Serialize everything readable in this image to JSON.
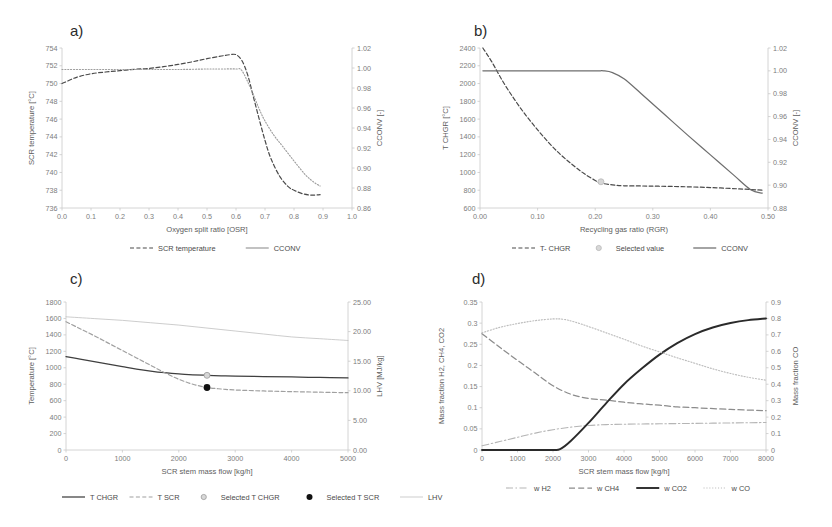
{
  "figure": {
    "panels": [
      "a)",
      "b)",
      "c)",
      "d)"
    ]
  },
  "chart_data": [
    {
      "id": "a",
      "type": "line",
      "panel_label": "a)",
      "title": "",
      "xlabel": "Oxygen split ratio [OSR]",
      "ylabel": "SCR temperature [°C]",
      "y2label": "CCONV [-]",
      "xlim": [
        0.0,
        1.0
      ],
      "ylim": [
        736,
        754
      ],
      "y2lim": [
        0.86,
        1.02
      ],
      "xticks": [
        "0.0",
        "0.1",
        "0.2",
        "0.3",
        "0.4",
        "0.5",
        "0.6",
        "0.7",
        "0.8",
        "0.9",
        "1.0"
      ],
      "yticks": [
        "736",
        "738",
        "740",
        "742",
        "744",
        "746",
        "748",
        "750",
        "752",
        "754"
      ],
      "y2ticks": [
        "0.86",
        "0.88",
        "0.90",
        "0.92",
        "0.94",
        "0.96",
        "0.98",
        "1.00",
        "1.02"
      ],
      "grid": false,
      "legend_position": "bottom",
      "series": [
        {
          "name": "SCR temperature",
          "style": "dashed",
          "color": "#4a4a4a",
          "axis": "left",
          "x": [
            0.0,
            0.05,
            0.1,
            0.15,
            0.2,
            0.25,
            0.3,
            0.35,
            0.4,
            0.45,
            0.5,
            0.55,
            0.58,
            0.6,
            0.62,
            0.64,
            0.66,
            0.68,
            0.7,
            0.72,
            0.75,
            0.78,
            0.8,
            0.83,
            0.86,
            0.89
          ],
          "values": [
            750.0,
            750.7,
            751.1,
            751.3,
            751.45,
            751.6,
            751.7,
            751.9,
            752.15,
            752.45,
            752.8,
            753.1,
            753.25,
            753.25,
            752.6,
            751.0,
            748.5,
            746.0,
            743.6,
            741.6,
            739.6,
            738.4,
            738.0,
            737.6,
            737.45,
            737.5
          ]
        },
        {
          "name": "CCONV",
          "style": "dotted",
          "color": "#9e9e9e",
          "axis": "right",
          "x": [
            0.0,
            0.1,
            0.2,
            0.3,
            0.4,
            0.5,
            0.55,
            0.6,
            0.62,
            0.65,
            0.68,
            0.7,
            0.73,
            0.76,
            0.8,
            0.84,
            0.87,
            0.89
          ],
          "values": [
            0.9985,
            0.9985,
            0.9985,
            0.9985,
            0.9985,
            0.999,
            0.999,
            0.999,
            0.9975,
            0.98,
            0.959,
            0.947,
            0.933,
            0.922,
            0.907,
            0.893,
            0.8855,
            0.882
          ]
        }
      ],
      "legend": [
        {
          "label": "SCR temperature",
          "style": "dashed",
          "color": "#4a4a4a"
        },
        {
          "label": "CCONV",
          "style": "solid",
          "color": "#9e9e9e"
        }
      ]
    },
    {
      "id": "b",
      "type": "line",
      "panel_label": "b)",
      "title": "",
      "xlabel": "Recycling gas ratio (RGR)",
      "ylabel": "T CHGR [°C]",
      "y2label": "CCONV [-]",
      "xlim": [
        0.0,
        0.5
      ],
      "ylim": [
        600,
        2400
      ],
      "y2lim": [
        0.88,
        1.02
      ],
      "xticks": [
        "0.00",
        "0.10",
        "0.20",
        "0.30",
        "0.40",
        "0.50"
      ],
      "yticks": [
        "600",
        "800",
        "1000",
        "1200",
        "1400",
        "1600",
        "1800",
        "2000",
        "2200",
        "2400"
      ],
      "y2ticks": [
        "0.88",
        "0.90",
        "0.92",
        "0.94",
        "0.96",
        "0.98",
        "1.00",
        "1.02"
      ],
      "grid": false,
      "legend_position": "bottom",
      "series": [
        {
          "name": "T- CHGR",
          "style": "dashed",
          "color": "#4a4a4a",
          "axis": "left",
          "x": [
            0.005,
            0.02,
            0.04,
            0.06,
            0.08,
            0.1,
            0.12,
            0.14,
            0.16,
            0.18,
            0.2,
            0.21,
            0.23,
            0.25,
            0.28,
            0.31,
            0.35,
            0.4,
            0.45,
            0.49
          ],
          "values": [
            2400,
            2250,
            2020,
            1820,
            1640,
            1480,
            1330,
            1200,
            1090,
            990,
            910,
            880,
            860,
            850,
            848,
            845,
            840,
            830,
            815,
            800
          ]
        },
        {
          "name": "CCONV",
          "style": "solid",
          "color": "#6e6e6e",
          "axis": "right",
          "x": [
            0.005,
            0.05,
            0.1,
            0.15,
            0.2,
            0.215,
            0.23,
            0.25,
            0.28,
            0.32,
            0.36,
            0.4,
            0.44,
            0.47,
            0.49
          ],
          "values": [
            1.0,
            1.0,
            1.0,
            1.0,
            1.0,
            1.0,
            0.9985,
            0.993,
            0.98,
            0.962,
            0.944,
            0.9265,
            0.909,
            0.896,
            0.893
          ]
        }
      ],
      "markers": [
        {
          "name": "Selected value",
          "x": 0.21,
          "y": 895,
          "axis": "left",
          "color": "#b9b9b9"
        }
      ],
      "legend": [
        {
          "label": "T- CHGR",
          "style": "dashed",
          "color": "#4a4a4a"
        },
        {
          "label": "Selected value",
          "style": "marker-open",
          "color": "#b9b9b9"
        },
        {
          "label": "CCONV",
          "style": "solid",
          "color": "#6e6e6e"
        }
      ]
    },
    {
      "id": "c",
      "type": "line",
      "panel_label": "c)",
      "title": "",
      "xlabel": "SCR stem mass flow [kg/h]",
      "ylabel": "Temperature [°C]",
      "y2label": "LHV [MJ/kg]",
      "xlim": [
        0,
        5000
      ],
      "ylim": [
        0,
        1800
      ],
      "y2lim": [
        0.0,
        25.0
      ],
      "xticks": [
        "0",
        "1000",
        "2000",
        "3000",
        "4000",
        "5000"
      ],
      "yticks": [
        "0",
        "200",
        "400",
        "600",
        "800",
        "1000",
        "1200",
        "1400",
        "1600",
        "1800"
      ],
      "y2ticks": [
        "0.00",
        "5.00",
        "10.00",
        "15.00",
        "20.00",
        "25.00"
      ],
      "grid": false,
      "legend_position": "bottom",
      "series": [
        {
          "name": "T CHGR",
          "style": "solid",
          "color": "#3f3f3f",
          "axis": "left",
          "x": [
            0,
            250,
            500,
            750,
            1000,
            1250,
            1500,
            1750,
            2000,
            2250,
            2500,
            2750,
            3000,
            3500,
            4000,
            4500,
            5000
          ],
          "values": [
            1135,
            1105,
            1075,
            1045,
            1015,
            985,
            960,
            940,
            925,
            915,
            908,
            902,
            898,
            893,
            888,
            882,
            876
          ]
        },
        {
          "name": "T SCR",
          "style": "dashed",
          "color": "#a0a0a0",
          "axis": "left",
          "x": [
            0,
            250,
            500,
            750,
            1000,
            1250,
            1500,
            1750,
            2000,
            2250,
            2500,
            2750,
            3000,
            3500,
            4000,
            4500,
            5000
          ],
          "values": [
            1560,
            1475,
            1390,
            1300,
            1210,
            1120,
            1030,
            940,
            860,
            800,
            760,
            742,
            730,
            718,
            710,
            703,
            697
          ]
        },
        {
          "name": "LHV",
          "style": "solid-thin",
          "color": "#c0c0c0",
          "axis": "right",
          "x": [
            0,
            500,
            1000,
            1500,
            2000,
            2500,
            3000,
            3500,
            4000,
            4500,
            5000
          ],
          "values": [
            22.5,
            22.2,
            21.9,
            21.5,
            21.1,
            20.6,
            20.1,
            19.6,
            19.1,
            18.8,
            18.5
          ]
        }
      ],
      "markers": [
        {
          "name": "Selected T CHGR",
          "x": 2500,
          "y": 908,
          "axis": "left",
          "color": "#9a9a9a",
          "filled": false
        },
        {
          "name": "Selected T SCR",
          "x": 2500,
          "y": 760,
          "axis": "left",
          "color": "#111111",
          "filled": true
        }
      ],
      "legend": [
        {
          "label": "T CHGR",
          "style": "solid",
          "color": "#3f3f3f"
        },
        {
          "label": "T SCR",
          "style": "dashed",
          "color": "#a0a0a0"
        },
        {
          "label": "Selected T CHGR",
          "style": "marker-open",
          "color": "#9a9a9a"
        },
        {
          "label": "Selected T SCR",
          "style": "marker-filled",
          "color": "#111111"
        },
        {
          "label": "LHV",
          "style": "solid-thin",
          "color": "#c0c0c0"
        }
      ]
    },
    {
      "id": "d",
      "type": "line",
      "panel_label": "d)",
      "title": "",
      "xlabel": "SCR stem mass flow [kg/h]",
      "ylabel": "Mass fraction H2, CH4, CO2",
      "y2label": "Mass fraction CO",
      "xlim": [
        0,
        8000
      ],
      "ylim": [
        0,
        0.35
      ],
      "y2lim": [
        0,
        0.9
      ],
      "xticks": [
        "0",
        "1000",
        "2000",
        "3000",
        "4000",
        "5000",
        "6000",
        "7000",
        "8000"
      ],
      "yticks": [
        "0",
        "0.05",
        "0.1",
        "0.15",
        "0.2",
        "0.25",
        "0.3",
        "0.35"
      ],
      "y2ticks": [
        "0",
        "0.1",
        "0.2",
        "0.3",
        "0.4",
        "0.5",
        "0.6",
        "0.7",
        "0.8",
        "0.9"
      ],
      "grid": false,
      "legend_position": "bottom",
      "series": [
        {
          "name": "w H2",
          "style": "dashdot",
          "color": "#b5b5b5",
          "axis": "left",
          "x": [
            0,
            500,
            1000,
            1500,
            2000,
            2500,
            3000,
            3500,
            4000,
            5000,
            6000,
            7000,
            8000
          ],
          "values": [
            0.01,
            0.02,
            0.03,
            0.04,
            0.048,
            0.054,
            0.058,
            0.06,
            0.061,
            0.062,
            0.063,
            0.064,
            0.065
          ]
        },
        {
          "name": "w CH4",
          "style": "dashed-long",
          "color": "#8c8c8c",
          "axis": "left",
          "x": [
            0,
            500,
            1000,
            1500,
            2000,
            2500,
            3000,
            3500,
            4000,
            4500,
            5000,
            5500,
            6000,
            7000,
            8000
          ],
          "values": [
            0.275,
            0.243,
            0.212,
            0.182,
            0.152,
            0.132,
            0.122,
            0.118,
            0.113,
            0.109,
            0.106,
            0.102,
            0.1,
            0.096,
            0.093
          ]
        },
        {
          "name": "w CO2",
          "style": "solid-thick",
          "color": "#2a2a2a",
          "axis": "right",
          "x": [
            0,
            500,
            1000,
            1500,
            2000,
            2200,
            2500,
            3000,
            3500,
            4000,
            4500,
            5000,
            5500,
            6000,
            6500,
            7000,
            7500,
            8000
          ],
          "values": [
            0.0,
            0.0,
            0.0,
            0.0,
            0.0,
            0.005,
            0.055,
            0.165,
            0.285,
            0.4,
            0.495,
            0.58,
            0.65,
            0.705,
            0.745,
            0.772,
            0.79,
            0.8
          ]
        },
        {
          "name": "w CO",
          "style": "dotted",
          "color": "#bdbdbd",
          "axis": "left",
          "x": [
            0,
            500,
            1000,
            1500,
            2000,
            2300,
            2600,
            3000,
            3500,
            4000,
            4500,
            5000,
            5500,
            6000,
            6500,
            7000,
            7500,
            8000
          ],
          "values": [
            0.277,
            0.29,
            0.299,
            0.306,
            0.31,
            0.309,
            0.303,
            0.292,
            0.277,
            0.262,
            0.246,
            0.232,
            0.218,
            0.205,
            0.192,
            0.181,
            0.172,
            0.165
          ]
        }
      ],
      "legend": [
        {
          "label": "w H2",
          "style": "dashdot",
          "color": "#b5b5b5"
        },
        {
          "label": "w CH4",
          "style": "dashed-long",
          "color": "#8c8c8c"
        },
        {
          "label": "w CO2",
          "style": "solid-thick",
          "color": "#2a2a2a"
        },
        {
          "label": "w CO",
          "style": "dotted",
          "color": "#bdbdbd"
        }
      ]
    }
  ]
}
